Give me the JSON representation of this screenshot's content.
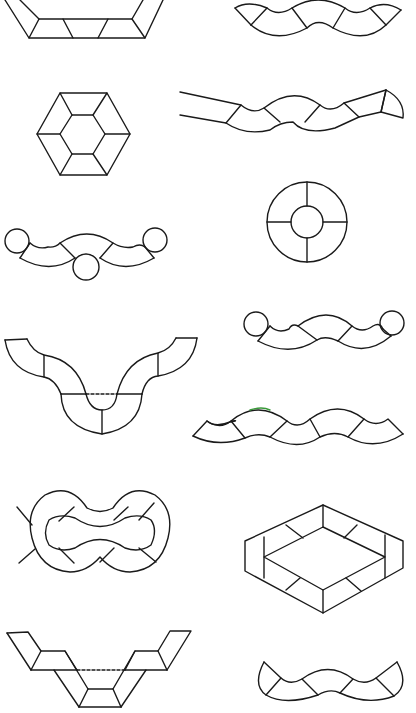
{
  "page": {
    "background": "#ffffff",
    "line_color": "#1a1a1a",
    "accent_stroke": "#3a9a3a"
  },
  "figures": [
    {
      "id": "trapezoid-frame-top",
      "description": "Inverted trapezoid frame made of parallelogram segments",
      "column": "left",
      "row": 1
    },
    {
      "id": "wave-band-top",
      "description": "Wavy band divided into arc segments",
      "column": "right",
      "row": 1
    },
    {
      "id": "hexagon-ring",
      "description": "Hexagon ring of six trapezoid tiles around inner hexagon",
      "column": "left",
      "row": 2
    },
    {
      "id": "wave-band-with-wedges",
      "description": "Wavy band with quarter-circle wedge ends",
      "column": "right",
      "row": 2
    },
    {
      "id": "annulus-four-segments",
      "description": "Ring with inner circle divided into four quadrants",
      "column": "right",
      "row": 3
    },
    {
      "id": "wave-band-three-circles",
      "description": "Wavy band with circles at both ends and beneath centre",
      "column": "left",
      "row": 3
    },
    {
      "id": "u-curve-band",
      "description": "U-shaped curved band with dashed centre line",
      "column": "left",
      "row": 4
    },
    {
      "id": "wave-band-two-circles",
      "description": "Wavy band with circles on both ends",
      "column": "right",
      "row": 4
    },
    {
      "id": "long-wave-band",
      "description": "Long wavy band with six segments",
      "column": "right",
      "row": 5
    },
    {
      "id": "figure-eight-ring",
      "description": "Figure-eight double ring divided into segments",
      "column": "left",
      "row": 6
    },
    {
      "id": "rhombus-frame",
      "description": "Isometric rhombus frame with segmented border",
      "column": "right",
      "row": 6
    },
    {
      "id": "double-trapezoid-frame",
      "description": "Stepped trapezoid frame with dashed top line",
      "column": "left",
      "row": 7
    },
    {
      "id": "crescent-wave-band",
      "description": "Wavy band with pointed crescent ends",
      "column": "right",
      "row": 7
    }
  ]
}
